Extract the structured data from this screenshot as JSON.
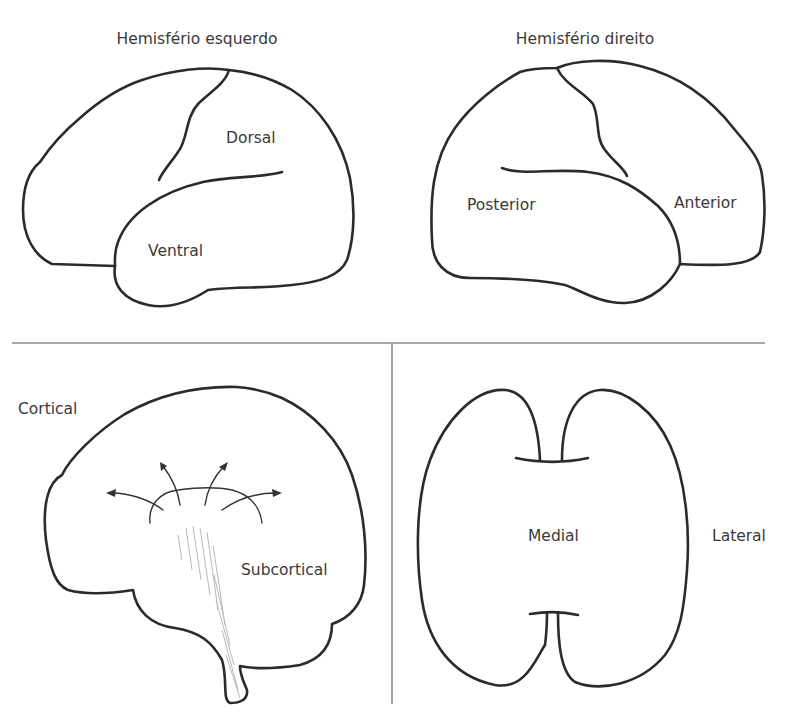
{
  "panels": {
    "top_left": {
      "title": "Hemisfério esquerdo",
      "labels": {
        "upper": "Dorsal",
        "lower": "Ventral"
      }
    },
    "top_right": {
      "title": "Hemisfério direito",
      "labels": {
        "back": "Posterior",
        "front": "Anterior"
      }
    },
    "bottom_left": {
      "labels": {
        "outer": "Cortical",
        "inner": "Subcortical"
      }
    },
    "bottom_right": {
      "labels": {
        "center": "Medial",
        "side": "Lateral"
      }
    }
  },
  "colors": {
    "outline": "#2b2b2b",
    "divider": "#8a8a8a",
    "hatch": "#b8b8b8",
    "text": "#3a3a3a"
  }
}
